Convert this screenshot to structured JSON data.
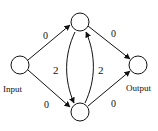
{
  "diagram": {
    "nodes": [
      {
        "id": "input",
        "label": "Input"
      },
      {
        "id": "top",
        "label": ""
      },
      {
        "id": "bottom",
        "label": ""
      },
      {
        "id": "output",
        "label": "Output"
      }
    ],
    "edges": [
      {
        "from": "input",
        "to": "top",
        "weight": "0"
      },
      {
        "from": "input",
        "to": "bottom",
        "weight": "0"
      },
      {
        "from": "top",
        "to": "output",
        "weight": "0"
      },
      {
        "from": "bottom",
        "to": "output",
        "weight": "0"
      },
      {
        "from": "top",
        "to": "bottom",
        "weight": "2"
      },
      {
        "from": "bottom",
        "to": "top",
        "weight": "2"
      }
    ],
    "colors": {
      "stroke": "#111111",
      "background": "#ffffff"
    }
  }
}
